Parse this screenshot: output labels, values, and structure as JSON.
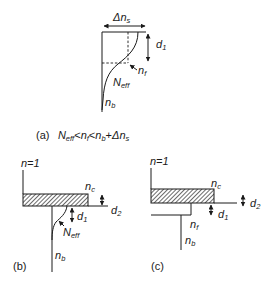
{
  "figure": {
    "panels": [
      {
        "id": "a",
        "caption_label": "(a)",
        "caption_condition": {
          "lhs": "N",
          "lhs_sub": "eff",
          "op1": "<",
          "mid": "n",
          "mid_sub": "f",
          "op2": "<",
          "rhs1": "n",
          "rhs1_sub": "b",
          "plus": "+",
          "rhs2": "Δn",
          "rhs2_sub": "s"
        },
        "labels": {
          "delta_ns": "Δn",
          "delta_ns_sub": "s",
          "d1": "d",
          "d1_sub": "1",
          "nf": "n",
          "nf_sub": "f",
          "neff": "N",
          "neff_sub": "eff",
          "nb": "n",
          "nb_sub": "b"
        }
      },
      {
        "id": "b",
        "caption_label": "(b)",
        "labels": {
          "n_air": "n=1",
          "nc": "n",
          "nc_sub": "c",
          "d2": "d",
          "d2_sub": "2",
          "d1": "d",
          "d1_sub": "1",
          "neff": "N",
          "neff_sub": "eff",
          "nb": "n",
          "nb_sub": "b"
        }
      },
      {
        "id": "c",
        "caption_label": "(c)",
        "labels": {
          "n_air": "n=1",
          "nc": "n",
          "nc_sub": "c",
          "d2": "d",
          "d2_sub": "2",
          "d1": "d",
          "d1_sub": "1",
          "nf": "n",
          "nf_sub": "f",
          "nb": "n",
          "nb_sub": "b"
        }
      }
    ],
    "colors": {
      "ink": "#1a1a1a",
      "background": "#ffffff"
    }
  }
}
